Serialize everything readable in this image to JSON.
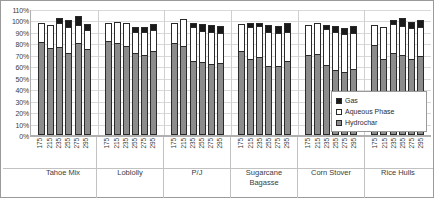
{
  "chart_data": {
    "type": "bar",
    "subtype": "stacked-bar-grouped",
    "title": "",
    "xlabel": "",
    "ylabel": "",
    "ylim": [
      0,
      110
    ],
    "y_ticks": [
      "0%",
      "10%",
      "20%",
      "30%",
      "40%",
      "50%",
      "60%",
      "70%",
      "80%",
      "90%",
      "100%",
      "110%"
    ],
    "grid": true,
    "legend_position": "inside-right",
    "legend": [
      "Gas",
      "Aqueous Phase",
      "Hydrochar"
    ],
    "series_colors": {
      "Gas": "#1a1a1a",
      "Aqueous Phase": "#ffffff",
      "Hydrochar": "#8c8c8c"
    },
    "categories": [
      "Tahoe Mix",
      "Loblolly",
      "P/J",
      "Sugarcane Bagasse",
      "Corn Stover",
      "Rice Hulls"
    ],
    "subcategories": [
      "175",
      "215",
      "235",
      "255",
      "275",
      "295"
    ],
    "groups": [
      {
        "name": "Tahoe Mix",
        "bars": [
          {
            "temp": "175",
            "Hydrochar": 81,
            "Aqueous Phase": 17,
            "Gas": 0
          },
          {
            "temp": "215",
            "Hydrochar": 76,
            "Aqueous Phase": 20,
            "Gas": 0
          },
          {
            "temp": "235",
            "Hydrochar": 77,
            "Aqueous Phase": 21,
            "Gas": 4
          },
          {
            "temp": "255",
            "Hydrochar": 72,
            "Aqueous Phase": 22,
            "Gas": 6
          },
          {
            "temp": "275",
            "Hydrochar": 80,
            "Aqueous Phase": 16,
            "Gas": 8
          },
          {
            "temp": "295",
            "Hydrochar": 75,
            "Aqueous Phase": 17,
            "Gas": 5
          }
        ]
      },
      {
        "name": "Loblolly",
        "bars": [
          {
            "temp": "175",
            "Hydrochar": 82,
            "Aqueous Phase": 16,
            "Gas": 0
          },
          {
            "temp": "215",
            "Hydrochar": 80,
            "Aqueous Phase": 19,
            "Gas": 0
          },
          {
            "temp": "235",
            "Hydrochar": 78,
            "Aqueous Phase": 20,
            "Gas": 0
          },
          {
            "temp": "255",
            "Hydrochar": 72,
            "Aqueous Phase": 18,
            "Gas": 4
          },
          {
            "temp": "275",
            "Hydrochar": 70,
            "Aqueous Phase": 20,
            "Gas": 4
          },
          {
            "temp": "295",
            "Hydrochar": 73,
            "Aqueous Phase": 19,
            "Gas": 5
          }
        ]
      },
      {
        "name": "P/J",
        "bars": [
          {
            "temp": "175",
            "Hydrochar": 80,
            "Aqueous Phase": 18,
            "Gas": 0
          },
          {
            "temp": "215",
            "Hydrochar": 78,
            "Aqueous Phase": 23,
            "Gas": 0
          },
          {
            "temp": "235",
            "Hydrochar": 65,
            "Aqueous Phase": 29,
            "Gas": 4
          },
          {
            "temp": "255",
            "Hydrochar": 64,
            "Aqueous Phase": 27,
            "Gas": 6
          },
          {
            "temp": "275",
            "Hydrochar": 62,
            "Aqueous Phase": 28,
            "Gas": 6
          },
          {
            "temp": "295",
            "Hydrochar": 63,
            "Aqueous Phase": 26,
            "Gas": 6
          }
        ]
      },
      {
        "name": "Sugarcane Bagasse",
        "bars": [
          {
            "temp": "175",
            "Hydrochar": 73,
            "Aqueous Phase": 24,
            "Gas": 0
          },
          {
            "temp": "215",
            "Hydrochar": 66,
            "Aqueous Phase": 28,
            "Gas": 4
          },
          {
            "temp": "235",
            "Hydrochar": 68,
            "Aqueous Phase": 27,
            "Gas": 3
          },
          {
            "temp": "255",
            "Hydrochar": 60,
            "Aqueous Phase": 30,
            "Gas": 6
          },
          {
            "temp": "275",
            "Hydrochar": 60,
            "Aqueous Phase": 29,
            "Gas": 6
          },
          {
            "temp": "295",
            "Hydrochar": 65,
            "Aqueous Phase": 25,
            "Gas": 8
          }
        ]
      },
      {
        "name": "Corn Stover",
        "bars": [
          {
            "temp": "175",
            "Hydrochar": 70,
            "Aqueous Phase": 26,
            "Gas": 0
          },
          {
            "temp": "215",
            "Hydrochar": 71,
            "Aqueous Phase": 27,
            "Gas": 0
          },
          {
            "temp": "235",
            "Hydrochar": 61,
            "Aqueous Phase": 32,
            "Gas": 3
          },
          {
            "temp": "255",
            "Hydrochar": 57,
            "Aqueous Phase": 33,
            "Gas": 5
          },
          {
            "temp": "275",
            "Hydrochar": 55,
            "Aqueous Phase": 33,
            "Gas": 5
          },
          {
            "temp": "295",
            "Hydrochar": 58,
            "Aqueous Phase": 31,
            "Gas": 6
          }
        ]
      },
      {
        "name": "Rice Hulls",
        "bars": [
          {
            "temp": "175",
            "Hydrochar": 79,
            "Aqueous Phase": 17,
            "Gas": 0
          },
          {
            "temp": "215",
            "Hydrochar": 66,
            "Aqueous Phase": 28,
            "Gas": 0
          },
          {
            "temp": "235",
            "Hydrochar": 72,
            "Aqueous Phase": 25,
            "Gas": 3
          },
          {
            "temp": "255",
            "Hydrochar": 70,
            "Aqueous Phase": 25,
            "Gas": 7
          },
          {
            "temp": "275",
            "Hydrochar": 66,
            "Aqueous Phase": 27,
            "Gas": 6
          },
          {
            "temp": "295",
            "Hydrochar": 69,
            "Aqueous Phase": 25,
            "Gas": 6
          }
        ]
      }
    ]
  }
}
